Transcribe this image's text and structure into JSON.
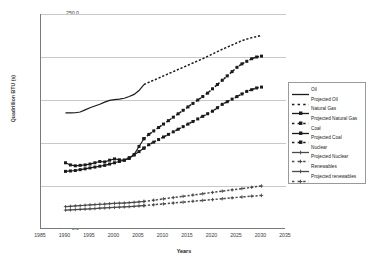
{
  "chart_data": {
    "type": "line",
    "title": "",
    "xlabel": "Years",
    "ylabel": "Quadrillion BTU (s)",
    "xlim": [
      1985,
      2035
    ],
    "ylim": [
      0.0,
      250.0
    ],
    "xticks": [
      "1985",
      "1990",
      "1995",
      "2000",
      "2005",
      "2010",
      "2015",
      "2020",
      "2025",
      "2030",
      "2035"
    ],
    "yticks": [
      "0.0",
      "50.0",
      "100.0",
      "150.0",
      "200.0",
      "250.0"
    ],
    "grid": "horizontal",
    "legend_position": "right",
    "series": [
      {
        "name": "Oil",
        "style": "solid-line",
        "marker": "none",
        "color": "#1a1a1a",
        "x": [
          1990,
          1991,
          1992,
          1993,
          1994,
          1995,
          1996,
          1997,
          1998,
          1999,
          2000,
          2001,
          2002,
          2003,
          2004,
          2005,
          2006
        ],
        "values": [
          135.0,
          135.0,
          135.2,
          136.0,
          138.5,
          141.0,
          143.0,
          145.0,
          147.5,
          149.5,
          150.5,
          151.0,
          152.0,
          154.0,
          156.5,
          161.0,
          168.0
        ]
      },
      {
        "name": "Projected Oil",
        "style": "dotted-line",
        "marker": "none",
        "color": "#1a1a1a",
        "x": [
          2006,
          2008,
          2010,
          2012,
          2014,
          2016,
          2018,
          2020,
          2022,
          2024,
          2026,
          2028,
          2030
        ],
        "values": [
          168.0,
          173.0,
          178.0,
          183.0,
          188.0,
          193.0,
          198.0,
          203.5,
          209.0,
          214.0,
          219.0,
          222.5,
          225.0
        ]
      },
      {
        "name": "Natural Gas",
        "style": "solid-line",
        "marker": "square",
        "color": "#1a1a1a",
        "x": [
          1990,
          1991,
          1992,
          1993,
          1994,
          1995,
          1996,
          1997,
          1998,
          1999,
          2000,
          2001,
          2002,
          2003,
          2004,
          2005,
          2006
        ],
        "values": [
          77.0,
          74.5,
          73.5,
          74.0,
          74.5,
          75.5,
          77.0,
          78.5,
          78.0,
          80.0,
          81.5,
          80.5,
          80.0,
          82.0,
          86.5,
          96.0,
          105.0
        ]
      },
      {
        "name": "Projected Natural Gas",
        "style": "dotted-line",
        "marker": "square",
        "color": "#1a1a1a",
        "x": [
          2006,
          2007,
          2008,
          2009,
          2010,
          2011,
          2012,
          2013,
          2014,
          2015,
          2016,
          2017,
          2018,
          2019,
          2020,
          2021,
          2022,
          2023,
          2024,
          2025,
          2026,
          2027,
          2028,
          2029,
          2030
        ],
        "values": [
          105.0,
          110.0,
          114.0,
          118.0,
          122.0,
          126.0,
          130.0,
          134.0,
          138.0,
          142.0,
          146.0,
          150.0,
          154.0,
          158.0,
          163.0,
          168.0,
          173.0,
          178.0,
          183.0,
          188.0,
          192.0,
          195.0,
          198.0,
          200.0,
          201.0
        ]
      },
      {
        "name": "Coal",
        "style": "solid-line",
        "marker": "square",
        "color": "#1a1a1a",
        "x": [
          1990,
          1991,
          1992,
          1993,
          1994,
          1995,
          1996,
          1997,
          1998,
          1999,
          2000,
          2001,
          2002,
          2003,
          2004,
          2005,
          2006
        ],
        "values": [
          67.0,
          67.5,
          68.0,
          69.0,
          70.0,
          71.0,
          72.0,
          73.0,
          74.0,
          75.5,
          77.0,
          78.5,
          80.0,
          83.0,
          86.0,
          90.0,
          94.0
        ]
      },
      {
        "name": "Projected Coal",
        "style": "dotted-line",
        "marker": "square",
        "color": "#1a1a1a",
        "x": [
          2006,
          2007,
          2008,
          2009,
          2010,
          2011,
          2012,
          2013,
          2014,
          2015,
          2016,
          2017,
          2018,
          2019,
          2020,
          2021,
          2022,
          2023,
          2024,
          2025,
          2026,
          2027,
          2028,
          2029,
          2030
        ],
        "values": [
          94.0,
          98.0,
          101.0,
          104.0,
          107.0,
          110.0,
          113.0,
          116.0,
          119.0,
          122.0,
          125.0,
          128.0,
          131.0,
          134.0,
          137.0,
          141.0,
          145.0,
          148.0,
          151.0,
          154.0,
          157.0,
          160.0,
          162.0,
          164.0,
          165.0
        ]
      },
      {
        "name": "Nuclear",
        "style": "solid-line",
        "marker": "cross",
        "color": "#4a4a4a",
        "x": [
          1990,
          1991,
          1992,
          1993,
          1994,
          1995,
          1996,
          1997,
          1998,
          1999,
          2000,
          2001,
          2002,
          2003,
          2004,
          2005,
          2006
        ],
        "values": [
          26.0,
          26.4,
          26.8,
          27.2,
          27.6,
          28.0,
          28.4,
          28.8,
          29.0,
          29.4,
          29.8,
          30.0,
          30.2,
          30.6,
          31.0,
          31.5,
          32.0
        ]
      },
      {
        "name": "Projected Nuclear",
        "style": "dotted-line",
        "marker": "cross",
        "color": "#4a4a4a",
        "x": [
          2006,
          2008,
          2010,
          2012,
          2014,
          2016,
          2018,
          2020,
          2022,
          2024,
          2026,
          2028,
          2030
        ],
        "values": [
          32.0,
          33.5,
          35.0,
          36.5,
          38.0,
          39.5,
          41.0,
          42.5,
          44.0,
          45.5,
          47.0,
          48.5,
          50.0
        ]
      },
      {
        "name": "Renewables",
        "style": "solid-line",
        "marker": "cross",
        "color": "#4a4a4a",
        "x": [
          1990,
          1991,
          1992,
          1993,
          1994,
          1995,
          1996,
          1997,
          1998,
          1999,
          2000,
          2001,
          2002,
          2003,
          2004,
          2005,
          2006
        ],
        "values": [
          22.0,
          22.3,
          22.6,
          22.9,
          23.2,
          23.5,
          23.8,
          24.2,
          24.5,
          24.8,
          25.1,
          25.4,
          25.7,
          26.0,
          26.4,
          26.8,
          27.2
        ]
      },
      {
        "name": "Projected renewables",
        "style": "dotted-line",
        "marker": "cross",
        "color": "#4a4a4a",
        "x": [
          2006,
          2008,
          2010,
          2012,
          2014,
          2016,
          2018,
          2020,
          2022,
          2024,
          2026,
          2028,
          2030
        ],
        "values": [
          27.2,
          28.2,
          29.2,
          30.2,
          31.2,
          32.2,
          33.2,
          34.2,
          35.2,
          36.2,
          37.2,
          38.2,
          39.0
        ]
      }
    ]
  }
}
